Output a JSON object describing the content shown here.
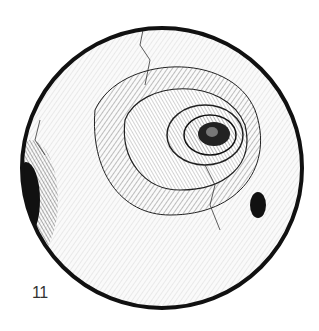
{
  "figure": {
    "plate_number": "11",
    "colors": {
      "ink": "#111111",
      "paper": "#ffffff",
      "number": "#333333"
    }
  }
}
